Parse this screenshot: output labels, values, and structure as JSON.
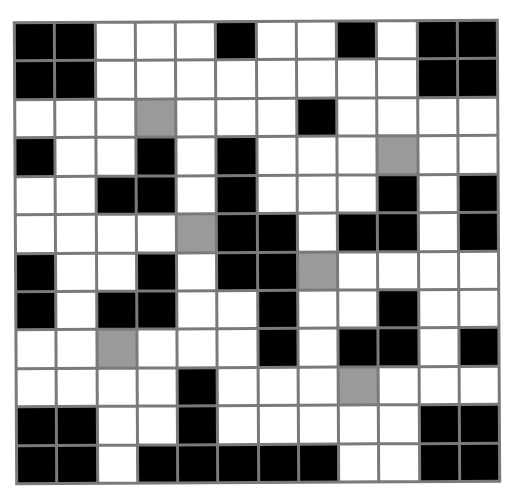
{
  "puzzle": {
    "rows": 12,
    "cols": 12,
    "legend": {
      "B": "black",
      "W": "white",
      "G": "gray"
    },
    "colors": {
      "black": "#000000",
      "white": "#ffffff",
      "gray": "#9a9a9a",
      "grid_line": "#7a7a7a"
    },
    "cells": [
      [
        "B",
        "B",
        "W",
        "W",
        "W",
        "B",
        "W",
        "W",
        "B",
        "W",
        "B",
        "B"
      ],
      [
        "B",
        "B",
        "W",
        "W",
        "W",
        "W",
        "W",
        "W",
        "W",
        "W",
        "B",
        "B"
      ],
      [
        "W",
        "W",
        "W",
        "G",
        "W",
        "W",
        "W",
        "B",
        "W",
        "W",
        "W",
        "W"
      ],
      [
        "B",
        "W",
        "W",
        "B",
        "W",
        "B",
        "W",
        "W",
        "W",
        "G",
        "W",
        "W"
      ],
      [
        "W",
        "W",
        "B",
        "B",
        "W",
        "B",
        "W",
        "W",
        "W",
        "B",
        "W",
        "B"
      ],
      [
        "W",
        "W",
        "W",
        "W",
        "G",
        "B",
        "B",
        "W",
        "B",
        "B",
        "W",
        "B"
      ],
      [
        "B",
        "W",
        "W",
        "B",
        "W",
        "B",
        "B",
        "G",
        "W",
        "W",
        "W",
        "W"
      ],
      [
        "B",
        "W",
        "B",
        "B",
        "W",
        "W",
        "B",
        "W",
        "W",
        "B",
        "W",
        "W"
      ],
      [
        "W",
        "W",
        "G",
        "W",
        "W",
        "W",
        "B",
        "W",
        "B",
        "B",
        "W",
        "B"
      ],
      [
        "W",
        "W",
        "W",
        "W",
        "B",
        "W",
        "W",
        "W",
        "G",
        "W",
        "W",
        "W"
      ],
      [
        "B",
        "B",
        "W",
        "W",
        "B",
        "W",
        "W",
        "W",
        "W",
        "W",
        "B",
        "B"
      ],
      [
        "B",
        "B",
        "W",
        "B",
        "B",
        "B",
        "B",
        "B",
        "W",
        "W",
        "B",
        "B"
      ]
    ]
  }
}
